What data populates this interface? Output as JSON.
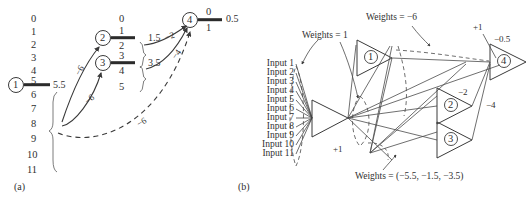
{
  "figure": {
    "panel_a": {
      "tag": "(a)",
      "index_column": [
        "0",
        "1",
        "2",
        "3",
        "4",
        "5",
        "6",
        "7",
        "8",
        "9",
        "10",
        "11"
      ],
      "nodes": [
        {
          "id": "node-1",
          "label": "1",
          "above": "5",
          "below": "6",
          "value": "5.5"
        },
        {
          "id": "node-2",
          "label": "2",
          "above": "1",
          "below": "2",
          "top_extra": "0",
          "value": "1.5"
        },
        {
          "id": "node-3",
          "label": "3",
          "above": "3",
          "below": "4",
          "bottom_extra": "5",
          "value": "3.5"
        },
        {
          "id": "node-4",
          "label": "4",
          "above": "0",
          "below": "1",
          "value": "0.5"
        }
      ],
      "edge_weights": {
        "one_to_two": "−6",
        "one_to_three": "−6",
        "two_to_four": "−2",
        "three_to_four": "−4",
        "dashed_to_four": "−6"
      }
    },
    "panel_b": {
      "tag": "(b)",
      "inputs": [
        "Input 1",
        "Input 2",
        "Input 3",
        "Input 4",
        "Input 5",
        "Input 6",
        "Input 7",
        "Input 8",
        "Input 9",
        "Input 10",
        "Input 11"
      ],
      "annotations": {
        "weights_one": "Weights = 1",
        "weights_minus_six": "Weights = −6",
        "weights_triple": "Weights = (−5.5, −1.5, −3.5)",
        "bias_plus_one_top": "+1",
        "bias_plus_one_bottom": "+1",
        "out_bias": "−0.5",
        "w_minus_two": "−2",
        "w_minus_four": "−4"
      },
      "neurons": [
        {
          "id": "tri-1",
          "label": "1"
        },
        {
          "id": "tri-2",
          "label": "2"
        },
        {
          "id": "tri-3",
          "label": "3"
        },
        {
          "id": "tri-4",
          "label": "4"
        }
      ]
    },
    "colors": {
      "ink": "#303030",
      "line": "#4a4a4a",
      "background": "#ffffff"
    }
  }
}
